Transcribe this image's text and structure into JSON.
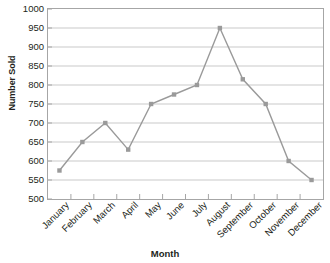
{
  "chart_data": {
    "type": "line",
    "title": "",
    "xlabel": "Month",
    "ylabel": "Number Sold",
    "categories": [
      "January",
      "February",
      "March",
      "April",
      "May",
      "June",
      "July",
      "August",
      "September",
      "October",
      "November",
      "December"
    ],
    "values": [
      575,
      650,
      700,
      630,
      750,
      775,
      800,
      950,
      815,
      750,
      600,
      550
    ],
    "series": [
      {
        "name": "Number Sold",
        "values": [
          575,
          650,
          700,
          630,
          750,
          775,
          800,
          950,
          815,
          750,
          600,
          550
        ]
      }
    ],
    "ylim": [
      500,
      1000
    ],
    "ytick_step": 50,
    "yticks": [
      1000,
      950,
      900,
      850,
      800,
      750,
      700,
      650,
      600,
      550,
      500
    ],
    "ytick_labels": [
      "1000",
      "950",
      "900",
      "850",
      "800",
      "750",
      "700",
      "650",
      "600",
      "550",
      "500"
    ],
    "grid": "horizontal",
    "legend": "none",
    "line_color": "#9a9a9a",
    "marker_color": "#9a9a9a",
    "marker_shape": "square",
    "gridline_color": "#c9c9c9",
    "axis_color": "#a6a6a6",
    "background_color": "#ffffff"
  }
}
